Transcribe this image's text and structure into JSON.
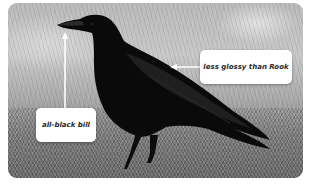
{
  "image": {
    "subject": "crow",
    "style": "grayscale photo with callout annotations"
  },
  "annotations": [
    {
      "id": "bill",
      "label": "all-black bill",
      "arrow_direction": "up"
    },
    {
      "id": "gloss",
      "label": "less glossy than Rook",
      "arrow_direction": "left"
    }
  ],
  "colors": {
    "callout_background": "#ffffff",
    "callout_text": "#2a2a2a",
    "arrow": "#ffffff",
    "frame_border": "#ffffff"
  }
}
